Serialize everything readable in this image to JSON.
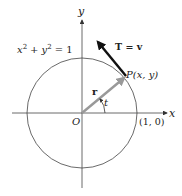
{
  "diagram": {
    "equation": {
      "lhs_x": "x",
      "sup1": "2",
      "plus": "+",
      "lhs_y": "y",
      "sup2": "2",
      "rhs": "= 1"
    },
    "axis_x_label": "x",
    "axis_y_label": "y",
    "origin_label": "O",
    "point_label": "P(x, y)",
    "unit_point_label": "(1, 0)",
    "position_vector_label": "r",
    "angle_label": "t",
    "tangent_label": "T = v",
    "colors": {
      "line": "#333333",
      "position_vector": "#999999",
      "tangent_vector": "#111111"
    }
  }
}
